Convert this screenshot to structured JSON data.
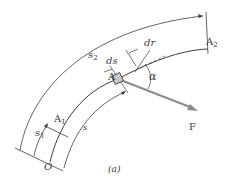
{
  "figure": {
    "caption": "(a)",
    "colors": {
      "line": "#3c3c3c",
      "force_arrow": "#8c8c8c",
      "block_fill": "#c8c8c8"
    }
  },
  "labels": {
    "A": "A",
    "A1": "A",
    "A1_sub": "1",
    "A2": "A",
    "A2_sub": "2",
    "s1": "s",
    "s1_sub": "1",
    "s2": "s",
    "s2_sub": "2",
    "s": "s",
    "ds": "ds",
    "dr": "dr",
    "alpha": "α",
    "F": "F",
    "O": "O"
  }
}
